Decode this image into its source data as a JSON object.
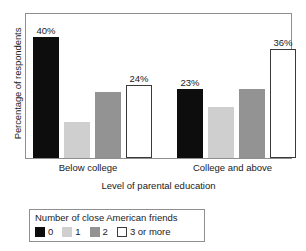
{
  "chart_data": {
    "type": "bar",
    "title": "",
    "xlabel": "Level of parental education",
    "ylabel": "Percentage of respondents",
    "categories": [
      "Below college",
      "College and above"
    ],
    "series": [
      {
        "name": "0",
        "color": "#0d0d0d",
        "values": [
          40,
          23
        ],
        "labels": [
          "40%",
          "23%"
        ]
      },
      {
        "name": "1",
        "color": "#cfcfcf",
        "values": [
          12,
          17
        ],
        "labels": [
          "",
          ""
        ]
      },
      {
        "name": "2",
        "color": "#939393",
        "values": [
          22,
          23
        ],
        "labels": [
          "",
          ""
        ]
      },
      {
        "name": "3 or more",
        "color": "#ffffff",
        "values": [
          24,
          36
        ],
        "labels": [
          "24%",
          "36%"
        ]
      }
    ],
    "ylim": [
      0,
      48
    ],
    "grid": false,
    "legend_position": "bottom-left",
    "legend_title": "Number of close American friends"
  },
  "legend": {
    "title": "Number of close American friends",
    "items": [
      {
        "label": "0"
      },
      {
        "label": "1"
      },
      {
        "label": "2"
      },
      {
        "label": "3 or more"
      }
    ]
  },
  "axes": {
    "y_title": "Percentage of respondents",
    "x_title": "Level of parental education",
    "category_labels": [
      "Below college",
      "College and above"
    ]
  },
  "value_labels": {
    "g0_s0": "40%",
    "g0_s3": "24%",
    "g1_s0": "23%",
    "g1_s3": "36%"
  }
}
